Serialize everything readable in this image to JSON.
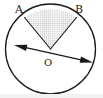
{
  "figure": {
    "kind": "geometry-diagram",
    "canvas": {
      "width": 103,
      "height": 98,
      "background": "#ffffff"
    },
    "colors": {
      "stroke": "#1a1a1a",
      "hatch": "#b9b9b9",
      "hatch_fill": "#fbfbfb",
      "label": "#1a1a1a",
      "bottom_band": "#f2f2f2"
    },
    "circle": {
      "name": "circle-O",
      "center": {
        "x": 50.5,
        "y": 49
      },
      "radius": 45,
      "stroke_width": 1.3
    },
    "sector": {
      "name": "sector-AOB",
      "apex": {
        "x": 50.5,
        "y": 49
      },
      "start_point": {
        "x": 24.5,
        "y": 17.5
      },
      "end_point": {
        "x": 76.5,
        "y": 17.5
      },
      "fill": "cross-hatch",
      "hatch_spacing_px": 2.1,
      "central_angle_deg": 70
    },
    "arrow": {
      "name": "double-headed-arrow",
      "from": {
        "x": 14,
        "y": 45
      },
      "to": {
        "x": 93,
        "y": 62.5
      },
      "double_headed": true,
      "stroke_width": 1.2,
      "head_length": 13,
      "head_half_width": 3.2
    },
    "labels": [
      {
        "id": "A",
        "text": "A",
        "x": 15,
        "y": 4,
        "anchor": "point-A"
      },
      {
        "id": "B",
        "text": "B",
        "x": 75,
        "y": 4,
        "anchor": "point-B"
      },
      {
        "id": "O",
        "text": "O",
        "x": 44,
        "y": 57,
        "anchor": "center-O"
      }
    ]
  }
}
